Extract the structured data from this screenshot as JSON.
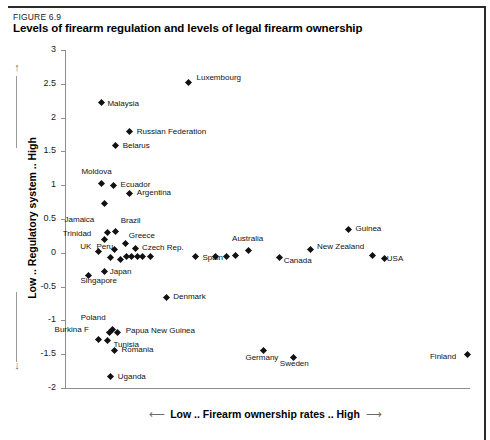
{
  "figure": {
    "number": "FIGURE 6.9",
    "title": "Levels of firearm regulation and levels of legal firearm ownership"
  },
  "axes": {
    "y_title": "Low .. Regulatory system .. High",
    "x_title": "Low .. Firearm ownership rates .. High",
    "y_arrow_up": "↑",
    "y_arrow_down": "↓",
    "x_arrow_left": "⟵",
    "x_arrow_right": "⟶",
    "yticks": [
      "3",
      "2.5",
      "2",
      "1.5",
      "1",
      "0.5",
      "0",
      "-0.5",
      "-1",
      "-1.5",
      "-2"
    ]
  },
  "chart_data": {
    "type": "scatter",
    "title": "Levels of firearm regulation and levels of legal firearm ownership",
    "xlabel": "Low .. Firearm ownership rates .. High",
    "ylabel": "Low .. Regulatory system .. High",
    "ylim": [
      -2,
      3
    ],
    "ytick_values": [
      3,
      2.5,
      2,
      1.5,
      1,
      0.5,
      0,
      -0.5,
      -1,
      -1.5,
      -2
    ],
    "grid": false,
    "legend": null,
    "marker": "diamond",
    "marker_color": "#111111",
    "points": [
      {
        "label": "Luxembourg",
        "x": 0.305,
        "y": 2.52,
        "lx": 8,
        "ly": -4
      },
      {
        "label": "Malaysia",
        "x": 0.09,
        "y": 2.22,
        "lx": 6,
        "ly": 1
      },
      {
        "label": "Russian Federation",
        "x": 0.16,
        "y": 1.79,
        "lx": 7,
        "ly": 0
      },
      {
        "label": "Belarus",
        "x": 0.125,
        "y": 1.58,
        "lx": 7,
        "ly": 0
      },
      {
        "label": "Moldova",
        "x": 0.09,
        "y": 1.02,
        "lx": -20,
        "ly": -12
      },
      {
        "label": "Ecuador",
        "x": 0.12,
        "y": 1.0,
        "lx": 7,
        "ly": 0
      },
      {
        "label": "Argentina",
        "x": 0.16,
        "y": 0.88,
        "lx": 7,
        "ly": 0
      },
      {
        "label": "",
        "x": 0.097,
        "y": 0.73,
        "lx": 0,
        "ly": 0
      },
      {
        "label": "Jamaica",
        "x": 0.105,
        "y": 0.3,
        "lx": -43,
        "ly": -13
      },
      {
        "label": "Brazil",
        "x": 0.125,
        "y": 0.31,
        "lx": 5,
        "ly": -11
      },
      {
        "label": "Trinidad",
        "x": 0.098,
        "y": 0.2,
        "lx": -42,
        "ly": -5
      },
      {
        "label": "Greece",
        "x": 0.15,
        "y": 0.14,
        "lx": 3,
        "ly": -7
      },
      {
        "label": "UK",
        "x": 0.082,
        "y": 0.02,
        "lx": -18,
        "ly": -4
      },
      {
        "label": "Peru",
        "x": 0.122,
        "y": 0.05,
        "lx": -18,
        "ly": -2
      },
      {
        "label": "Czech Rep.",
        "x": 0.175,
        "y": 0.06,
        "lx": 6,
        "ly": -1
      },
      {
        "label": "",
        "x": 0.113,
        "y": -0.07,
        "lx": 0,
        "ly": 0
      },
      {
        "label": "",
        "x": 0.138,
        "y": -0.1,
        "lx": 0,
        "ly": 0
      },
      {
        "label": "",
        "x": 0.152,
        "y": -0.05,
        "lx": 0,
        "ly": 0
      },
      {
        "label": "",
        "x": 0.165,
        "y": -0.05,
        "lx": 0,
        "ly": 0
      },
      {
        "label": "",
        "x": 0.178,
        "y": -0.05,
        "lx": 0,
        "ly": 0
      },
      {
        "label": "",
        "x": 0.192,
        "y": -0.05,
        "lx": 0,
        "ly": 0
      },
      {
        "label": "",
        "x": 0.212,
        "y": -0.05,
        "lx": 0,
        "ly": 0
      },
      {
        "label": "Spain",
        "x": 0.322,
        "y": -0.06,
        "lx": 7,
        "ly": 1
      },
      {
        "label": "",
        "x": 0.372,
        "y": -0.05,
        "lx": 0,
        "ly": 0
      },
      {
        "label": "",
        "x": 0.398,
        "y": -0.05,
        "lx": 0,
        "ly": 0
      },
      {
        "label": "",
        "x": 0.42,
        "y": -0.04,
        "lx": 0,
        "ly": 0
      },
      {
        "label": "Australia",
        "x": 0.452,
        "y": 0.04,
        "lx": -16,
        "ly": -11
      },
      {
        "label": "Canada",
        "x": 0.53,
        "y": -0.07,
        "lx": 4,
        "ly": 3
      },
      {
        "label": "New Zealand",
        "x": 0.605,
        "y": 0.05,
        "lx": 7,
        "ly": -2
      },
      {
        "label": "Guinea",
        "x": 0.7,
        "y": 0.35,
        "lx": 7,
        "ly": 0
      },
      {
        "label": "USA",
        "x": 0.76,
        "y": -0.04,
        "lx": 14,
        "ly": 3
      },
      {
        "label": "",
        "x": 0.79,
        "y": -0.08,
        "lx": 0,
        "ly": 0
      },
      {
        "label": "Japan",
        "x": 0.098,
        "y": -0.28,
        "lx": 5,
        "ly": 0
      },
      {
        "label": "Singapore",
        "x": 0.058,
        "y": -0.33,
        "lx": -8,
        "ly": 6
      },
      {
        "label": "Denmark",
        "x": 0.25,
        "y": -0.66,
        "lx": 7,
        "ly": 0
      },
      {
        "label": "Poland",
        "x": 0.118,
        "y": -1.13,
        "lx": -32,
        "ly": -11
      },
      {
        "label": "Burkina F",
        "x": 0.11,
        "y": -1.18,
        "lx": -55,
        "ly": -3
      },
      {
        "label": "Papua New Guinea",
        "x": 0.13,
        "y": -1.18,
        "lx": 8,
        "ly": -2
      },
      {
        "label": "",
        "x": 0.083,
        "y": -1.28,
        "lx": 0,
        "ly": 0
      },
      {
        "label": "Tunisia",
        "x": 0.105,
        "y": -1.3,
        "lx": 6,
        "ly": 4
      },
      {
        "label": "Romania",
        "x": 0.122,
        "y": -1.44,
        "lx": 7,
        "ly": 0
      },
      {
        "label": "Germany",
        "x": 0.49,
        "y": -1.45,
        "lx": -18,
        "ly": 7
      },
      {
        "label": "Sweden",
        "x": 0.565,
        "y": -1.55,
        "lx": -14,
        "ly": 6
      },
      {
        "label": "Finland",
        "x": 0.995,
        "y": -1.5,
        "lx": -38,
        "ly": 3
      },
      {
        "label": "Uganda",
        "x": 0.113,
        "y": -1.83,
        "lx": 7,
        "ly": 0
      }
    ]
  }
}
